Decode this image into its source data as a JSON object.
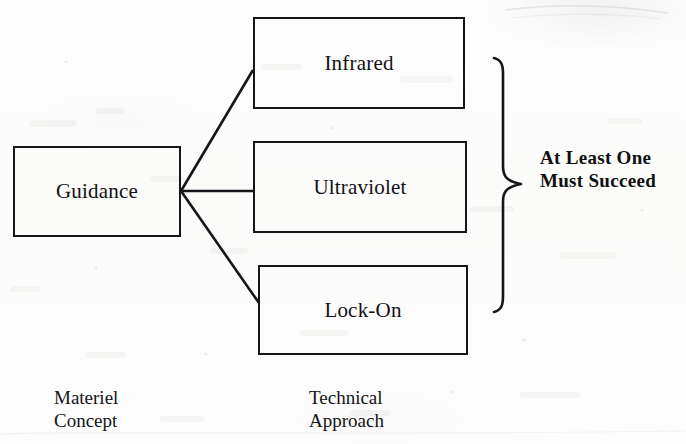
{
  "diagram": {
    "background_color": "#fdfdfd",
    "ink_color": "#16161a",
    "nodes": [
      {
        "id": "guidance",
        "label": "Guidance"
      },
      {
        "id": "infrared",
        "label": "Infrared"
      },
      {
        "id": "ultraviolet",
        "label": "Ultraviolet"
      },
      {
        "id": "lockon",
        "label": "Lock-On"
      }
    ],
    "edges": [
      {
        "from": "guidance",
        "to": "infrared",
        "style": "diagonal-up"
      },
      {
        "from": "guidance",
        "to": "ultraviolet",
        "style": "horizontal"
      },
      {
        "from": "guidance",
        "to": "lockon",
        "style": "diagonal-down"
      }
    ],
    "brace": {
      "icon": "right-curly-brace-icon",
      "groups": [
        "infrared",
        "ultraviolet",
        "lockon"
      ],
      "caption": "At Least One\nMust Succeed"
    },
    "captions": {
      "left_column": "Materiel\nConcept",
      "middle_column": "Technical\nApproach"
    }
  }
}
